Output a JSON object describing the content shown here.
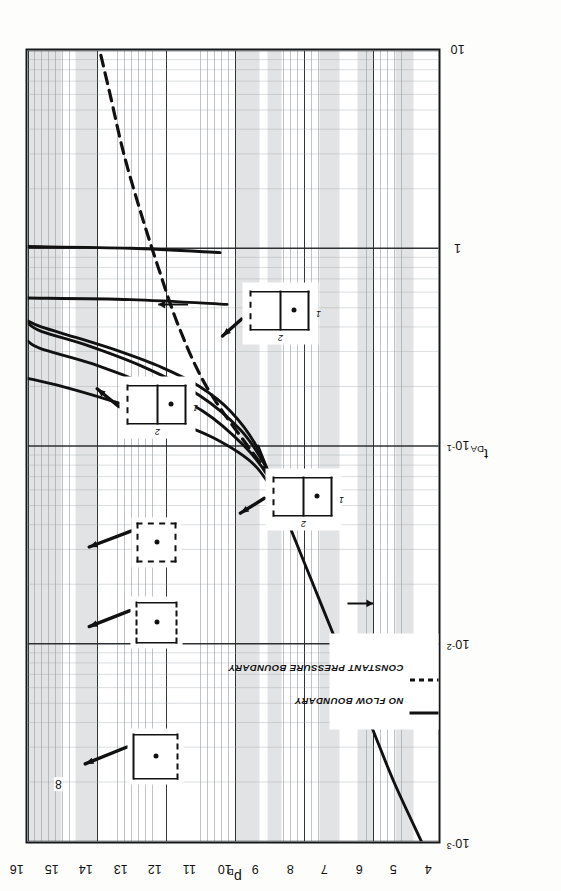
{
  "chart_data": {
    "type": "line",
    "title": "",
    "xlabel": "t_DA",
    "ylabel": "p_D",
    "xscale": "log",
    "yscale": "linear",
    "xlim": [
      0.001,
      10
    ],
    "ylim": [
      4,
      16
    ],
    "grid": true,
    "grid_style": "semi-log engineering graph paper",
    "xticks": [
      "10⁻³",
      "10⁻²",
      "10⁻¹",
      "1",
      "10"
    ],
    "xtick_values": [
      0.001,
      0.01,
      0.1,
      1,
      10
    ],
    "yticks": [
      "4",
      "5",
      "6",
      "7",
      "8",
      "9",
      "10",
      "11",
      "12",
      "13",
      "14",
      "15",
      "16"
    ],
    "ytick_values": [
      4,
      5,
      6,
      7,
      8,
      9,
      10,
      11,
      12,
      13,
      14,
      15,
      16
    ],
    "legend_position": "lower-left",
    "series": [
      {
        "name": "infinite-acting radial flow line",
        "style": "solid",
        "boundary": "no-flow",
        "points": [
          [
            0.001,
            4.55
          ],
          [
            0.002,
            5.35
          ],
          [
            0.004,
            6.05
          ],
          [
            0.01,
            7.0
          ],
          [
            0.02,
            7.7
          ],
          [
            0.04,
            8.4
          ],
          [
            0.07,
            8.95
          ],
          [
            0.1,
            9.3
          ]
        ]
      },
      {
        "name": "square, no-flow",
        "style": "solid",
        "boundary": "no-flow",
        "points": [
          [
            0.05,
            8.6
          ],
          [
            0.1,
            9.35
          ],
          [
            0.15,
            10.1
          ],
          [
            0.2,
            11.0
          ],
          [
            0.25,
            12.1
          ],
          [
            0.3,
            13.3
          ],
          [
            0.35,
            14.5
          ],
          [
            0.4,
            15.6
          ],
          [
            0.43,
            16.0
          ]
        ]
      },
      {
        "name": "2:1 rectangle, no-flow, well centered",
        "style": "solid",
        "boundary": "no-flow",
        "points": [
          [
            0.05,
            8.55
          ],
          [
            0.08,
            9.1
          ],
          [
            0.12,
            9.8
          ],
          [
            0.18,
            11.0
          ],
          [
            0.25,
            12.6
          ],
          [
            0.32,
            14.2
          ],
          [
            0.38,
            15.6
          ],
          [
            0.42,
            16.0
          ]
        ]
      },
      {
        "name": "2:1 rectangle, no-flow, well off-center",
        "style": "solid",
        "boundary": "no-flow",
        "points": [
          [
            0.04,
            8.3
          ],
          [
            0.07,
            9.0
          ],
          [
            0.1,
            9.7
          ],
          [
            0.15,
            10.9
          ],
          [
            0.2,
            12.4
          ],
          [
            0.26,
            14.1
          ],
          [
            0.31,
            15.6
          ],
          [
            0.34,
            16.0
          ]
        ]
      },
      {
        "name": "curve 8 - early steep no-flow",
        "style": "solid",
        "boundary": "no-flow",
        "label": "8",
        "points": [
          [
            0.05,
            8.6
          ],
          [
            0.08,
            9.4
          ],
          [
            0.11,
            10.6
          ],
          [
            0.14,
            12.1
          ],
          [
            0.17,
            13.6
          ],
          [
            0.2,
            15.0
          ],
          [
            0.22,
            16.0
          ]
        ]
      },
      {
        "name": "constant pressure boundary asymptote",
        "style": "dashed",
        "boundary": "constant-pressure",
        "points": [
          [
            0.06,
            8.6
          ],
          [
            0.1,
            9.6
          ],
          [
            0.2,
            10.8
          ],
          [
            0.4,
            11.6
          ],
          [
            0.8,
            12.2
          ],
          [
            1.5,
            12.7
          ],
          [
            3.0,
            13.2
          ],
          [
            6.0,
            13.6
          ],
          [
            10,
            13.9
          ]
        ]
      },
      {
        "name": "vertical no-flow asymptote A",
        "style": "solid",
        "boundary": "no-flow",
        "points": [
          [
            0.52,
            10.2
          ],
          [
            0.55,
            13.0
          ],
          [
            0.56,
            16.0
          ]
        ]
      },
      {
        "name": "vertical no-flow asymptote B",
        "style": "solid",
        "boundary": "no-flow",
        "points": [
          [
            0.95,
            10.4
          ],
          [
            1.0,
            13.0
          ],
          [
            1.02,
            16.0
          ]
        ]
      }
    ],
    "annotations": [
      {
        "text": "8",
        "x": 0.0145,
        "y": 15.25,
        "type": "curve-number-tag"
      },
      {
        "text": "",
        "x": 0.016,
        "y": 5.95,
        "type": "down-arrow"
      },
      {
        "text": "",
        "x": 0.52,
        "y": 12.2,
        "type": "up-arrow"
      }
    ]
  },
  "axes": {
    "x": {
      "label_text": "t",
      "label_sub": "DA",
      "ticks": [
        {
          "text": "10",
          "sup": "-3",
          "value": 0.001
        },
        {
          "text": "10",
          "sup": "-2",
          "value": 0.01
        },
        {
          "text": "10",
          "sup": "-1",
          "value": 0.1
        },
        {
          "text": "1",
          "sup": "",
          "value": 1
        },
        {
          "text": "10",
          "sup": "",
          "value": 10
        }
      ]
    },
    "y": {
      "label_text": "p",
      "label_sub": "D",
      "ticks": [
        {
          "text": "4",
          "value": 4
        },
        {
          "text": "5",
          "value": 5
        },
        {
          "text": "6",
          "value": 6
        },
        {
          "text": "7",
          "value": 7
        },
        {
          "text": "8",
          "value": 8
        },
        {
          "text": "9",
          "value": 9
        },
        {
          "text": "10",
          "value": 10
        },
        {
          "text": "11",
          "value": 11
        },
        {
          "text": "12",
          "value": 12
        },
        {
          "text": "13",
          "value": 13
        },
        {
          "text": "14",
          "value": 14
        },
        {
          "text": "15",
          "value": 15
        },
        {
          "text": "16",
          "value": 16
        }
      ]
    }
  },
  "legend": {
    "entries": [
      {
        "label": "NO FLOW BOUNDARY",
        "style": "solid"
      },
      {
        "label": "CONSTANT PRESSURE BOUNDARY",
        "style": "dashed"
      }
    ]
  },
  "shape_icons": [
    {
      "id": "square-3solid-1dashed",
      "description": "square, well centered, three no-flow sides and one constant-pressure side",
      "shape": "square",
      "well": "center",
      "edges": {
        "top": "solid",
        "right": "solid",
        "bottom": "dashed",
        "left": "solid"
      },
      "labels": {
        "left": "",
        "bottom": ""
      }
    },
    {
      "id": "square-2solid-2dashed",
      "description": "square, well centered, two opposite no-flow sides and two constant-pressure sides",
      "shape": "square",
      "well": "center",
      "edges": {
        "top": "dashed",
        "right": "solid",
        "bottom": "dashed",
        "left": "solid"
      },
      "labels": {
        "left": "",
        "bottom": ""
      }
    },
    {
      "id": "square-all-dashed",
      "description": "square, well centered, all sides constant pressure",
      "shape": "square",
      "well": "center",
      "edges": {
        "top": "dashed",
        "right": "dashed",
        "bottom": "dashed",
        "left": "dashed"
      },
      "labels": {
        "left": "",
        "bottom": ""
      }
    },
    {
      "id": "rect-2x1-a",
      "description": "2:1 rectangle, dashed top edge, well in lower half",
      "shape": "rectangle-2x1",
      "well": "lower-half-center",
      "edges": {
        "top": "dashed",
        "right": "solid",
        "bottom": "solid",
        "left": "solid"
      },
      "labels": {
        "left": "2",
        "bottom": "1"
      }
    },
    {
      "id": "rect-2x1-b",
      "description": "2:1 rectangle, dashed top edge, well in lower half",
      "shape": "rectangle-2x1",
      "well": "lower-half-center",
      "edges": {
        "top": "dashed",
        "right": "solid",
        "bottom": "solid",
        "left": "solid"
      },
      "labels": {
        "left": "2",
        "bottom": "1"
      }
    },
    {
      "id": "rect-2x1-c",
      "description": "2:1 rectangle, dashed top edge, well in lower half",
      "shape": "rectangle-2x1",
      "well": "lower-half-center",
      "edges": {
        "top": "dashed",
        "right": "solid",
        "bottom": "solid",
        "left": "solid"
      },
      "labels": {
        "left": "2",
        "bottom": "1"
      }
    }
  ],
  "colors": {
    "curve": "#111111",
    "grid_major": "#2a2d30",
    "grid_minor": "#9aa0a4",
    "frame": "#16181a",
    "band": "#b9bcbe",
    "paper": "#ffffff"
  }
}
